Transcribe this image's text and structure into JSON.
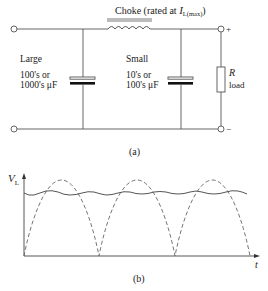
{
  "circuit": {
    "choke_label": "Choke (rated at ",
    "choke_symbol": "I",
    "choke_subscript": "L(max)",
    "choke_close": ")",
    "left_cap": {
      "title": "Large",
      "line1": "100's or",
      "line2": "1000's μF"
    },
    "right_cap": {
      "title": "Small",
      "line1": "10's or",
      "line2": "100's μF"
    },
    "load_symbol": "R",
    "load_label": "load",
    "plus": "+",
    "minus": "−",
    "caption": "(a)"
  },
  "waveform": {
    "y_axis_symbol": "V",
    "y_axis_subscript": "L",
    "x_axis_label": "t",
    "caption": "(b)",
    "series": [
      {
        "name": "rectified (unsmoothed)",
        "style": "dashed",
        "description": "full-wave rectified sine, 3 half-cycles"
      },
      {
        "name": "smoothed output",
        "style": "solid",
        "description": "near-constant DC with small ripple"
      }
    ]
  },
  "colors": {
    "line": "#555555",
    "plate": "#111111",
    "text": "#222222"
  }
}
